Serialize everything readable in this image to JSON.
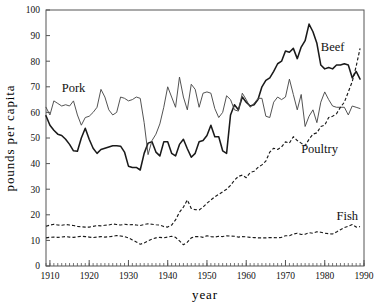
{
  "chart_data": {
    "type": "line",
    "title": "",
    "xlabel": "year",
    "ylabel": "pounds per capita",
    "xlim": [
      1909,
      1990
    ],
    "ylim": [
      0,
      100
    ],
    "y_ticks": [
      0,
      10,
      20,
      30,
      40,
      50,
      60,
      70,
      80,
      90,
      100
    ],
    "x_ticks": [
      1910,
      1920,
      1930,
      1940,
      1950,
      1960,
      1970,
      1980,
      1990
    ],
    "x_minor_step": 1,
    "grid": false,
    "legend": "inline-annotations",
    "annotations": [
      {
        "text": "Pork",
        "x": 1913,
        "y": 68
      },
      {
        "text": "Beef",
        "x": 1979,
        "y": 84
      },
      {
        "text": "Poultry",
        "x": 1974,
        "y": 44
      },
      {
        "text": "Fish",
        "x": 1983,
        "y": 18
      }
    ],
    "x": [
      1909,
      1910,
      1911,
      1912,
      1913,
      1914,
      1915,
      1916,
      1917,
      1918,
      1919,
      1920,
      1921,
      1922,
      1923,
      1924,
      1925,
      1926,
      1927,
      1928,
      1929,
      1930,
      1931,
      1932,
      1933,
      1934,
      1935,
      1936,
      1937,
      1938,
      1939,
      1940,
      1941,
      1942,
      1943,
      1944,
      1945,
      1946,
      1947,
      1948,
      1949,
      1950,
      1951,
      1952,
      1953,
      1954,
      1955,
      1956,
      1957,
      1958,
      1959,
      1960,
      1961,
      1962,
      1963,
      1964,
      1965,
      1966,
      1967,
      1968,
      1969,
      1970,
      1971,
      1972,
      1973,
      1974,
      1975,
      1976,
      1977,
      1978,
      1979,
      1980,
      1981,
      1982,
      1983,
      1984,
      1985,
      1986,
      1987,
      1988,
      1989
    ],
    "series": [
      {
        "name": "Beef",
        "style": "solid-thick",
        "values": [
          58.7,
          55.0,
          53.0,
          51.5,
          51.0,
          49.5,
          47.5,
          45.0,
          44.8,
          50.0,
          53.8,
          49.5,
          46.0,
          44.0,
          45.5,
          46.0,
          46.5,
          47.0,
          47.0,
          46.8,
          44.5,
          39.0,
          38.5,
          38.5,
          37.5,
          44.0,
          48.0,
          48.5,
          44.5,
          43.0,
          48.5,
          48.5,
          44.0,
          43.0,
          47.5,
          49.5,
          45.8,
          42.5,
          44.0,
          48.5,
          49.0,
          51.0,
          55.0,
          50.5,
          50.5,
          45.0,
          44.0,
          59.0,
          63.0,
          61.0,
          66.0,
          64.0,
          62.5,
          63.0,
          65.0,
          70.0,
          72.5,
          73.5,
          76.0,
          79.0,
          80.0,
          84.0,
          83.5,
          85.0,
          81.0,
          85.5,
          88.0,
          94.5,
          91.5,
          87.0,
          78.5,
          77.0,
          77.5,
          77.0,
          78.5,
          78.5,
          79.0,
          78.5,
          73.5,
          76.0,
          73.0
        ]
      },
      {
        "name": "Pork",
        "style": "solid-thin",
        "values": [
          62.0,
          59.0,
          64.5,
          63.5,
          62.5,
          63.0,
          62.5,
          64.5,
          59.0,
          55.0,
          58.0,
          58.5,
          60.0,
          62.0,
          69.0,
          66.0,
          61.0,
          59.0,
          60.0,
          66.0,
          65.5,
          64.5,
          65.0,
          66.0,
          65.5,
          56.0,
          43.5,
          49.0,
          51.5,
          55.5,
          62.0,
          70.0,
          66.0,
          62.0,
          73.8,
          66.0,
          61.0,
          71.0,
          69.0,
          62.0,
          67.5,
          68.0,
          67.5,
          61.5,
          58.0,
          60.0,
          66.5,
          65.0,
          61.0,
          60.5,
          67.5,
          65.0,
          62.0,
          63.5,
          65.5,
          65.5,
          58.5,
          58.0,
          64.0,
          66.0,
          65.0,
          66.0,
          73.0,
          67.0,
          61.0,
          67.0,
          54.5,
          58.5,
          61.0,
          56.0,
          64.0,
          68.0,
          65.0,
          62.5,
          62.0,
          62.0,
          62.0,
          59.0,
          62.5,
          62.0,
          61.5
        ]
      },
      {
        "name": "Poultry",
        "style": "dashed",
        "values": [
          15.5,
          16.0,
          16.3,
          16.0,
          15.9,
          16.2,
          16.0,
          15.8,
          15.5,
          15.3,
          15.2,
          15.2,
          15.5,
          15.8,
          15.7,
          15.9,
          16.0,
          16.4,
          16.2,
          16.0,
          16.3,
          16.1,
          16.2,
          16.0,
          15.8,
          16.2,
          16.5,
          16.3,
          16.1,
          16.0,
          15.4,
          15.2,
          16.0,
          18.0,
          21.0,
          23.0,
          25.8,
          22.5,
          22.0,
          21.9,
          23.0,
          24.5,
          25.8,
          27.0,
          28.0,
          29.0,
          30.0,
          31.5,
          33.5,
          35.0,
          35.5,
          34.5,
          36.5,
          37.0,
          38.5,
          39.5,
          41.0,
          44.5,
          46.0,
          45.5,
          46.5,
          48.5,
          48.0,
          50.5,
          49.0,
          48.0,
          47.0,
          49.5,
          51.5,
          52.0,
          54.5,
          55.0,
          58.0,
          58.5,
          59.5,
          62.0,
          64.0,
          68.0,
          72.0,
          78.0,
          85.0
        ]
      },
      {
        "name": "Fish",
        "style": "dashed",
        "values": [
          11.0,
          11.2,
          11.3,
          11.2,
          11.3,
          11.5,
          11.3,
          11.2,
          11.4,
          11.6,
          11.5,
          11.3,
          11.1,
          11.3,
          11.5,
          11.3,
          11.4,
          11.6,
          11.9,
          11.7,
          11.5,
          11.0,
          10.2,
          9.4,
          8.5,
          9.0,
          9.8,
          10.5,
          11.0,
          11.2,
          11.0,
          11.3,
          11.6,
          11.2,
          9.8,
          8.3,
          9.3,
          11.0,
          11.5,
          11.5,
          11.2,
          11.8,
          11.5,
          11.3,
          11.6,
          11.5,
          11.8,
          11.7,
          11.6,
          11.3,
          11.5,
          11.4,
          11.2,
          11.1,
          11.0,
          11.0,
          11.0,
          11.1,
          11.1,
          11.0,
          11.2,
          11.8,
          11.8,
          12.5,
          12.8,
          12.3,
          12.4,
          13.0,
          12.8,
          13.4,
          13.2,
          12.8,
          12.6,
          12.5,
          13.3,
          14.2,
          15.0,
          15.5,
          16.2,
          15.2,
          15.4
        ]
      }
    ]
  }
}
